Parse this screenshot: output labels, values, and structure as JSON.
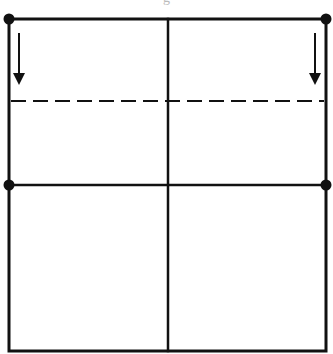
{
  "diagram": {
    "type": "fold-instruction",
    "caption_fragment": "g",
    "colors": {
      "stroke": "#111111",
      "background": "#ffffff"
    },
    "square": {
      "left": 9,
      "top": 19,
      "right": 326,
      "bottom": 351
    },
    "divisions": {
      "vertical_center_x": 168,
      "horizontal_middle_y": 185
    },
    "fold_line": {
      "style": "dashed",
      "y": 101,
      "dash": 15,
      "gap": 7
    },
    "arrows": [
      {
        "name": "left-down-arrow",
        "x": 19,
        "y1": 34,
        "y2": 85,
        "direction": "down"
      },
      {
        "name": "right-down-arrow",
        "x": 315,
        "y1": 34,
        "y2": 85,
        "direction": "down"
      }
    ],
    "dots": [
      {
        "name": "top-left-dot",
        "x": 9,
        "y": 19
      },
      {
        "name": "top-right-dot",
        "x": 326,
        "y": 19
      },
      {
        "name": "middle-left-dot",
        "x": 9,
        "y": 185
      },
      {
        "name": "middle-right-dot",
        "x": 326,
        "y": 185
      }
    ]
  }
}
